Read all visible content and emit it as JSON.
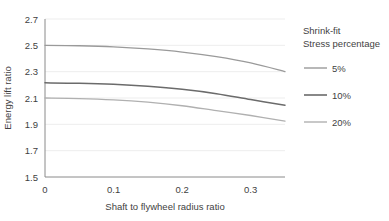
{
  "chart_data": {
    "type": "line",
    "title": "",
    "xlabel": "Shaft to flywheel radius ratio",
    "ylabel": "Energy lift ratio",
    "xlim": [
      0,
      0.35
    ],
    "ylim": [
      1.5,
      2.7
    ],
    "xticks": [
      "0",
      "0.1",
      "0.2",
      "0.3"
    ],
    "xtick_values": [
      0,
      0.1,
      0.2,
      0.3
    ],
    "yticks": [
      "1.5",
      "1.7",
      "1.9",
      "2.1",
      "2.3",
      "2.5",
      "2.7"
    ],
    "ytick_values": [
      1.5,
      1.7,
      1.9,
      2.1,
      2.3,
      2.5,
      2.7
    ],
    "grid": true,
    "legend_position": "right",
    "legend_title_lines": [
      "Shrink-fit",
      "Stress percentage"
    ],
    "x": [
      0,
      0.05,
      0.1,
      0.15,
      0.2,
      0.25,
      0.3,
      0.35
    ],
    "series": [
      {
        "name": "5%",
        "color": "#9a9a9a",
        "values": [
          2.5,
          2.497,
          2.489,
          2.473,
          2.449,
          2.414,
          2.366,
          2.3
        ]
      },
      {
        "name": "10%",
        "color": "#6b6b6b",
        "values": [
          2.215,
          2.212,
          2.204,
          2.189,
          2.166,
          2.133,
          2.088,
          2.045
        ]
      },
      {
        "name": "20%",
        "color": "#b0b0b0",
        "values": [
          2.1,
          2.096,
          2.086,
          2.068,
          2.041,
          2.004,
          1.967,
          1.925
        ]
      }
    ]
  },
  "colors": {
    "axis": "#808080",
    "grid": "#ededed",
    "text": "#3f3f3f",
    "background": "#ffffff"
  }
}
